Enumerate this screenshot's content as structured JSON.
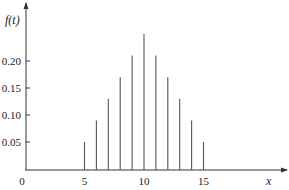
{
  "chart_data": {
    "type": "bar",
    "style": "stem",
    "title": "",
    "xlabel": "x",
    "ylabel": "f(t)",
    "x": [
      5,
      6,
      7,
      8,
      9,
      10,
      11,
      12,
      13,
      14,
      15
    ],
    "values": [
      0.05,
      0.09,
      0.13,
      0.17,
      0.21,
      0.25,
      0.21,
      0.17,
      0.13,
      0.09,
      0.05
    ],
    "xticks": [
      0,
      5,
      10,
      15
    ],
    "xtick_labels": [
      "0",
      "5",
      "10",
      "15"
    ],
    "yticks": [
      0.05,
      0.1,
      0.15,
      0.2
    ],
    "ytick_labels": [
      "0.05",
      "0.10",
      "0.15",
      "0.20"
    ],
    "xlim": [
      0,
      21.5
    ],
    "ylim": [
      0,
      0.31
    ],
    "grid": false,
    "legend": "none",
    "colors": {
      "axis": "#333333",
      "stem": "#555555",
      "text": "#222222"
    }
  }
}
